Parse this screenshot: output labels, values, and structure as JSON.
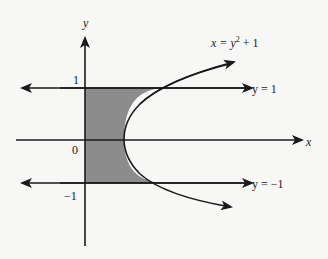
{
  "diagram": {
    "axes": {
      "x_label": "x",
      "y_label": "y"
    },
    "tick_labels": {
      "one": "1",
      "zero": "0",
      "neg_one": "−1"
    },
    "curve_label": {
      "lhs": "x = y",
      "exp": "2",
      "rhs": " + 1"
    },
    "lines": [
      {
        "label": "y = 1",
        "y": 1
      },
      {
        "label": "y = −1",
        "y": -1
      }
    ],
    "shaded_region": "between y-axis and x = y^2 + 1 for -1 <= y <= 1",
    "colors": {
      "shade": "#8c8c8c",
      "ink": "#1a1a1a",
      "background": "#f7f7f5"
    }
  }
}
